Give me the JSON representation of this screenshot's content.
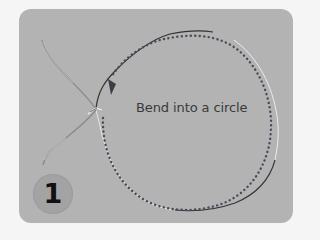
{
  "instruction": {
    "caption": "Bend into a circle",
    "step_number": "1"
  },
  "colors": {
    "page_background": "#f5f5f5",
    "card_background": "#b3b3b3",
    "wire": "#3a3a3a",
    "wire_highlight": "#eeeeee",
    "dotted_path": "#4a4a5a",
    "arrow": "#3d3d45",
    "badge": "#a3a3a3",
    "badge_text": "#111111"
  },
  "icons": {
    "direction_arrow": "arrowhead-down-left",
    "wire_ring": "bent-wire-circle"
  }
}
